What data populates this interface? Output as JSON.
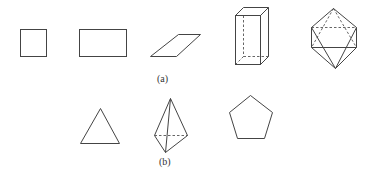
{
  "figure": {
    "labels": {
      "a": "(a)",
      "b": "(b)"
    },
    "row_a": [
      {
        "name": "square",
        "type": "2D"
      },
      {
        "name": "rectangle",
        "type": "2D"
      },
      {
        "name": "parallelogram",
        "type": "2D"
      },
      {
        "name": "rectangular-prism",
        "type": "3D"
      },
      {
        "name": "octahedron",
        "type": "3D"
      }
    ],
    "row_b": [
      {
        "name": "triangle",
        "type": "2D"
      },
      {
        "name": "tetrahedron",
        "type": "3D"
      },
      {
        "name": "pentagon",
        "type": "2D"
      }
    ],
    "colors": {
      "stroke": "#444444",
      "background": "#ffffff"
    }
  }
}
